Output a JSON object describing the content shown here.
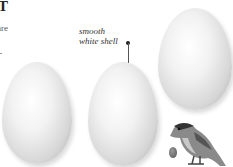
{
  "heading": {
    "partial_title": "T"
  },
  "intro_text": {
    "line1": "are",
    "line2": ""
  },
  "annotation": {
    "line1": "smooth",
    "line2": "white shell"
  },
  "illustration": {
    "eggs": [
      {
        "name": "egg-left",
        "color": "#e8e8e8"
      },
      {
        "name": "egg-middle",
        "color": "#e8e8e8"
      },
      {
        "name": "egg-right",
        "color": "#e8e8e8"
      }
    ],
    "small_egg": {
      "color": "#777777"
    },
    "bird": {
      "description": "perched bird illustration"
    }
  }
}
